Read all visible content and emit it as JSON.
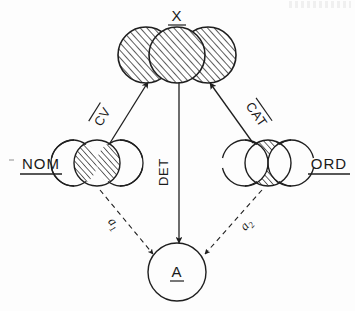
{
  "figure": {
    "type": "path-diagram"
  },
  "nodes": [
    {
      "id": "X",
      "label": "X",
      "underlined": true,
      "shape": "three-overlapping-circles",
      "fill": "hatched",
      "position": "top-center",
      "cx": 177,
      "cy": 55
    },
    {
      "id": "NOM",
      "label": "NOM",
      "underlined": true,
      "shape": "circle-with-two-side-lenses",
      "fill": "side-lenses-hatched",
      "position": "left",
      "cx": 97,
      "cy": 163
    },
    {
      "id": "ORD",
      "label": "ORD",
      "underlined": true,
      "shape": "circle-with-central-hourglass",
      "fill": "center-hatched",
      "position": "right",
      "cx": 268,
      "cy": 163
    },
    {
      "id": "A",
      "label": "A",
      "underlined": true,
      "shape": "plain-circle",
      "fill": "none",
      "position": "bottom-center",
      "cx": 177,
      "cy": 272
    }
  ],
  "edges": [
    {
      "id": "cv",
      "label": "CV",
      "overline": true,
      "from": "NOM",
      "to": "X",
      "style": "solid",
      "arrow": "single"
    },
    {
      "id": "cat",
      "label": "CAT",
      "overline": true,
      "from": "ORD",
      "to": "X",
      "style": "solid",
      "arrow": "single"
    },
    {
      "id": "det",
      "label": "DET",
      "overline": false,
      "from": "X",
      "to": "A",
      "style": "solid",
      "arrow": "single"
    },
    {
      "id": "a1",
      "label": "a",
      "subscript": "1",
      "from": "NOM",
      "to": "A",
      "style": "dashed",
      "arrow": "single"
    },
    {
      "id": "a2",
      "label": "a",
      "subscript": "2",
      "from": "ORD",
      "to": "A",
      "style": "dashed",
      "arrow": "single"
    }
  ],
  "colors": {
    "ink": "#1f1f1f",
    "hatch": "#262626",
    "background": "#fdfdfd"
  }
}
